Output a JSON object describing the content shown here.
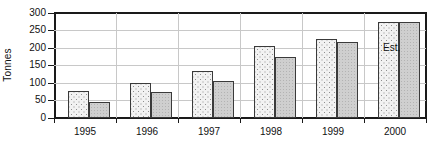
{
  "chart_data": {
    "type": "bar",
    "title": "",
    "xlabel": "",
    "ylabel": "Tonnes",
    "categories": [
      "1995",
      "1996",
      "1997",
      "1998",
      "1999",
      "2000"
    ],
    "series": [
      {
        "name": "series-1",
        "values": [
          78,
          100,
          135,
          205,
          227,
          275
        ]
      },
      {
        "name": "series-2",
        "values": [
          45,
          73,
          107,
          173,
          218,
          275
        ]
      }
    ],
    "ylim": [
      0,
      300
    ],
    "ytick_values": [
      0,
      50,
      100,
      150,
      200,
      250,
      300
    ],
    "ytick_labels": [
      "0",
      "50",
      "100",
      "150",
      "200",
      "250",
      "300"
    ],
    "grid": true,
    "grid_axis": "both",
    "legend": false,
    "legend_position": "none",
    "annotations": [
      {
        "text": "Est.",
        "category": "2000",
        "note": "estimated value label placed over the 2000 bars"
      }
    ],
    "colors": {
      "series_1_fill": "#f2f2f2",
      "series_1_pattern": "#8f8f8f",
      "series_2_fill": "#cfcfcf",
      "axis": "#1a1a1a",
      "grid": "#c8c8c8",
      "text": "#111111"
    }
  }
}
